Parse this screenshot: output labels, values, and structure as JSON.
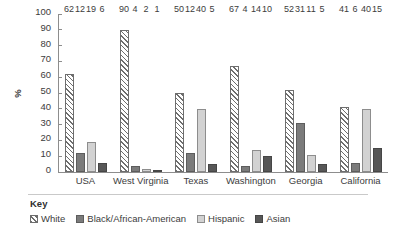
{
  "chart_data": {
    "type": "bar",
    "title": "",
    "subtitle": "",
    "xlabel": "",
    "ylabel": "%",
    "ylim": [
      0,
      100
    ],
    "ytick_step": 10,
    "yticks": [
      "100",
      "90",
      "80",
      "70",
      "60",
      "50",
      "40",
      "30",
      "20",
      "10",
      "0"
    ],
    "grid": false,
    "legend_position": "bottom-left",
    "categories": [
      "USA",
      "West Virginia",
      "Texas",
      "Washington",
      "Georgia",
      "California"
    ],
    "series": [
      {
        "name": "White",
        "values": [
          62,
          90,
          50,
          67,
          52,
          41
        ],
        "swatch": "hatched-diagonal",
        "color": "#ffffff"
      },
      {
        "name": "Black/African-American",
        "values": [
          12,
          4,
          12,
          4,
          31,
          6
        ],
        "swatch": "solid",
        "color": "#7b7b7b"
      },
      {
        "name": "Hispanic",
        "values": [
          19,
          2,
          40,
          14,
          11,
          40
        ],
        "swatch": "solid",
        "color": "#d2d2d2"
      },
      {
        "name": "Asian",
        "values": [
          6,
          1,
          5,
          10,
          5,
          15
        ],
        "swatch": "solid",
        "color": "#575757"
      }
    ]
  },
  "legend": {
    "title": "Key"
  },
  "axis": {
    "y_title": "%"
  }
}
